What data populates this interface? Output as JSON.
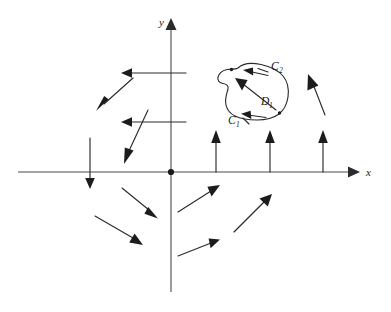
{
  "figure": {
    "background_color": "#ffffff",
    "ink_color": "#2b2b2b",
    "width": 391,
    "height": 312
  },
  "axes": {
    "x_label": "x",
    "y_label": "y",
    "origin_label": "",
    "x_axis": {
      "x_start": 18,
      "x_end": 356,
      "y": 172
    },
    "y_axis": {
      "y_start": 22,
      "y_end": 292,
      "x": 171
    },
    "origin": {
      "x": 171,
      "y": 172
    }
  },
  "curves": {
    "outer_label": "C",
    "outer_sub": "2",
    "inner_label": "C",
    "inner_sub": "1",
    "region_label": "D",
    "region_sub": "1",
    "outer_label_pos": {
      "x": 271,
      "y": 70
    },
    "inner_label_pos": {
      "x": 232,
      "y": 122
    },
    "region_label_pos": {
      "x": 261,
      "y": 105
    }
  },
  "vector_field": {
    "description": "vector field arrows around the origin",
    "arrows": [
      {
        "name": "arrow-q2-upper-left-leftward-high",
        "x1": 186,
        "y1": 73,
        "x2": 126,
        "y2": 73
      },
      {
        "name": "arrow-q2-upper-left-leftward-low",
        "x1": 186,
        "y1": 122,
        "x2": 126,
        "y2": 122
      },
      {
        "name": "arrow-q2-diagonal-upper",
        "x1": 133,
        "y1": 78,
        "x2": 98,
        "y2": 110
      },
      {
        "name": "arrow-q2-diagonal-lower",
        "x1": 148,
        "y1": 110,
        "x2": 124,
        "y2": 162
      },
      {
        "name": "arrow-negative-x-downward",
        "x1": 90,
        "y1": 138,
        "x2": 90,
        "y2": 185
      },
      {
        "name": "arrow-q3-upper",
        "x1": 122,
        "y1": 188,
        "x2": 155,
        "y2": 215
      },
      {
        "name": "arrow-q3-lower",
        "x1": 95,
        "y1": 216,
        "x2": 140,
        "y2": 242
      },
      {
        "name": "arrow-positive-x-up-inner",
        "x1": 216,
        "y1": 172,
        "x2": 216,
        "y2": 135
      },
      {
        "name": "arrow-positive-x-up-middle",
        "x1": 270,
        "y1": 172,
        "x2": 270,
        "y2": 135
      },
      {
        "name": "arrow-positive-x-up-outer",
        "x1": 323,
        "y1": 172,
        "x2": 323,
        "y2": 135
      },
      {
        "name": "arrow-q1-far-right-up-left",
        "x1": 325,
        "y1": 115,
        "x2": 308,
        "y2": 76
      },
      {
        "name": "arrow-q4-upper",
        "x1": 178,
        "y1": 212,
        "x2": 218,
        "y2": 186
      },
      {
        "name": "arrow-q4-middle",
        "x1": 234,
        "y1": 232,
        "x2": 270,
        "y2": 196
      },
      {
        "name": "arrow-q4-lower",
        "x1": 178,
        "y1": 256,
        "x2": 218,
        "y2": 240
      }
    ]
  }
}
